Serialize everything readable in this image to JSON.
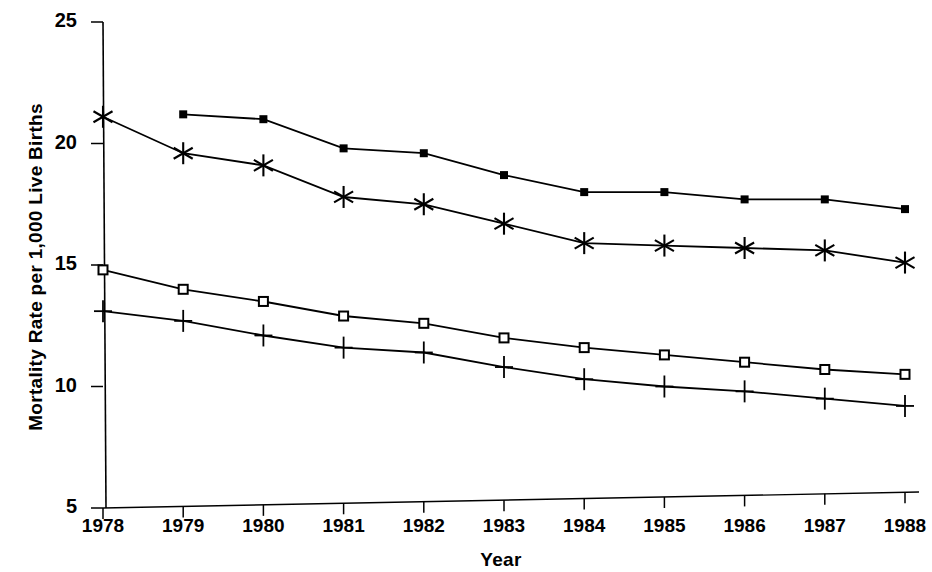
{
  "chart_data": {
    "type": "line",
    "title": "",
    "xlabel": "Year",
    "ylabel": "Mortality Rate per 1,000 Live Births",
    "x": [
      1978,
      1979,
      1980,
      1981,
      1982,
      1983,
      1984,
      1985,
      1986,
      1987,
      1988
    ],
    "categories": [
      "1978",
      "1979",
      "1980",
      "1981",
      "1982",
      "1983",
      "1984",
      "1985",
      "1986",
      "1987",
      "1988"
    ],
    "xlim": [
      1978,
      1988
    ],
    "ylim": [
      5,
      25
    ],
    "yticks": [
      5,
      10,
      15,
      20,
      25
    ],
    "ytick_labels": [
      "5",
      "10",
      "15",
      "20",
      "25"
    ],
    "xticks": [
      1978,
      1979,
      1980,
      1981,
      1982,
      1983,
      1984,
      1985,
      1986,
      1987,
      1988
    ],
    "xtick_labels": [
      "1978",
      "1979",
      "1980",
      "1981",
      "1982",
      "1983",
      "1984",
      "1985",
      "1986",
      "1987",
      "1988"
    ],
    "grid": false,
    "legend": "none",
    "line_color": "#000000",
    "series": [
      {
        "name": "series-filled-square",
        "marker": "filled-square",
        "x": [
          1979,
          1980,
          1981,
          1982,
          1983,
          1984,
          1985,
          1986,
          1987,
          1988
        ],
        "values": [
          21.2,
          21.0,
          19.8,
          19.6,
          18.7,
          18.0,
          18.0,
          17.7,
          17.7,
          17.3
        ]
      },
      {
        "name": "series-asterisk",
        "marker": "asterisk",
        "x": [
          1978,
          1979,
          1980,
          1981,
          1982,
          1983,
          1984,
          1985,
          1986,
          1987,
          1988
        ],
        "values": [
          21.1,
          19.6,
          19.1,
          17.8,
          17.5,
          16.7,
          15.9,
          15.8,
          15.7,
          15.6,
          15.1
        ]
      },
      {
        "name": "series-open-square",
        "marker": "open-square",
        "x": [
          1978,
          1979,
          1980,
          1981,
          1982,
          1983,
          1984,
          1985,
          1986,
          1987,
          1988
        ],
        "values": [
          14.8,
          14.0,
          13.5,
          12.9,
          12.6,
          12.0,
          11.6,
          11.3,
          11.0,
          10.7,
          10.5
        ]
      },
      {
        "name": "series-plus",
        "marker": "plus",
        "x": [
          1978,
          1979,
          1980,
          1981,
          1982,
          1983,
          1984,
          1985,
          1986,
          1987,
          1988
        ],
        "values": [
          13.1,
          12.7,
          12.1,
          11.6,
          11.4,
          10.8,
          10.3,
          10.0,
          9.8,
          9.5,
          9.2
        ]
      }
    ]
  },
  "axes": {
    "y_title": "Mortality Rate per 1,000 Live Births",
    "x_title": "Year"
  }
}
